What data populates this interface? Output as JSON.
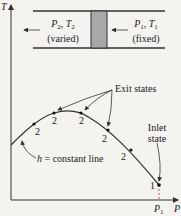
{
  "diagram": {
    "type": "T-P diagram of throttling process",
    "axes": {
      "y_label": "T",
      "x_label": "P",
      "x_tick": {
        "symbol": "P",
        "subscript": "1"
      }
    },
    "device": {
      "left_side": {
        "symbol": "P",
        "sub1": "2",
        "sep": ", ",
        "symbol2": "T",
        "sub2": "2",
        "note": "(varied)"
      },
      "right_side": {
        "symbol": "P",
        "sub1": "1",
        "sep": ", ",
        "symbol2": "T",
        "sub2": "1",
        "note": "(fixed)"
      },
      "plug_color": "#a8a8a8"
    },
    "curve_label": {
      "symbol": "h",
      "text": " = constant line"
    },
    "exit_states_label": "Exit states",
    "inlet_state_label": [
      "Inlet",
      "state"
    ],
    "points": [
      {
        "label": "2",
        "x": 34,
        "y": 124
      },
      {
        "label": "2",
        "x": 54,
        "y": 113
      },
      {
        "label": "2",
        "x": 81,
        "y": 113
      },
      {
        "label": "2",
        "x": 108,
        "y": 130
      },
      {
        "label": "2",
        "x": 131,
        "y": 150
      },
      {
        "label": "1",
        "x": 159,
        "y": 185
      }
    ],
    "colors": {
      "line": "#333333",
      "background": "#f4f3ef"
    }
  }
}
